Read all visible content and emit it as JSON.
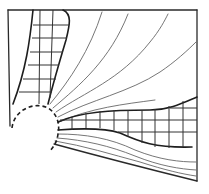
{
  "diagram": {
    "colors": {
      "background": "#ffffff",
      "ink": "#1e1e1e",
      "field_lines": "#666666"
    },
    "elements": {
      "frame": "rectangular boundary (top, left, right) with slanted bottom line",
      "source": "dashed circular arc",
      "left_band": "vertical gridded band (upper left)",
      "right_band": "horizontal gridded band (lower right)",
      "field_lines": "curved lines radiating from the source toward the upper right"
    },
    "field_line_count": 8
  }
}
